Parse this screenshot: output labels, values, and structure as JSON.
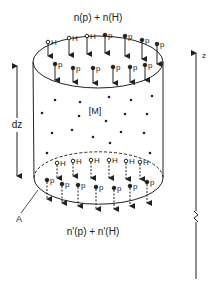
{
  "labels": {
    "top_flux": "n(p) + n(H)",
    "bottom_flux": "n'(p) + n'(H)",
    "volume": "[M]",
    "thickness": "dz",
    "area": "A",
    "axis": "z"
  },
  "particles": {
    "hydrogen": "H",
    "proton": "p"
  },
  "colors": {
    "ink": "#222222",
    "background": "#ffffff"
  }
}
